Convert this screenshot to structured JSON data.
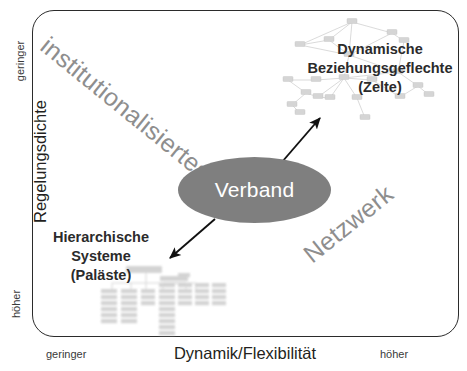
{
  "diagram": {
    "title_hidden": "",
    "axes": {
      "y": {
        "title": "Regelungsdichte",
        "top_end": "geringer",
        "bottom_end": "höher"
      },
      "x": {
        "title": "Dynamik/Flexibilität",
        "left_end": "geringer",
        "right_end": "höher"
      }
    },
    "diagonal_labels": {
      "upper_left": "institutionalisiertes",
      "lower_right": "Netzwerk"
    },
    "center_node": {
      "label": "Verband",
      "fill": "#7f7f7f",
      "text_color": "#ffffff"
    },
    "quadrants": [
      {
        "name": "top-right",
        "line1": "Dynamische",
        "line2": "Beziehungsgeflechte",
        "line3": "(Zelte)",
        "graphic": "network-graph"
      },
      {
        "name": "bottom-left",
        "line1": "Hierarchische",
        "line2": "Systeme",
        "line3": "(Paläste)",
        "graphic": "org-chart"
      }
    ],
    "arrows": [
      {
        "name": "arrow-to-zelte",
        "direction": "up-right"
      },
      {
        "name": "arrow-to-palaeste",
        "direction": "down-left"
      }
    ],
    "colors": {
      "frame": "#2b2b2b",
      "gray_label": "#8e8e8e",
      "graphic_gray": "#c9c9c9",
      "text": "#231f20"
    }
  }
}
